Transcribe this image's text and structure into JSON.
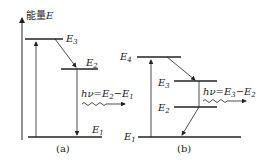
{
  "axis": {
    "label_cn": "能量",
    "label_var": "E"
  },
  "diagram_a": {
    "levels": [
      "E3",
      "E2",
      "E1"
    ],
    "emission": {
      "h": "hν",
      "eq": "=E2−E1"
    },
    "caption": "(a)"
  },
  "diagram_b": {
    "levels": [
      "E4",
      "E3",
      "E2",
      "E1"
    ],
    "emission": {
      "h": "hν",
      "eq": "=E3−E2"
    },
    "caption": "(b)"
  },
  "colors": {
    "line": "#222222",
    "background": "#ffffff"
  }
}
